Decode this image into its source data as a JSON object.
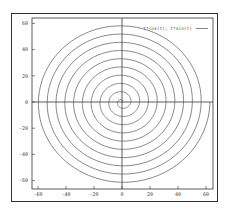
{
  "chart_data": {
    "type": "line",
    "title": "",
    "xlabel": "",
    "ylabel": "",
    "parametric": true,
    "series": [
      {
        "name": "t*cos(t), t*sin(t)",
        "x_expr": "t*cos(t)",
        "y_expr": "t*sin(t)",
        "t_range": [
          0,
          62.83
        ],
        "turns": 10,
        "color": "#555555"
      }
    ],
    "xticks": [
      -60,
      -40,
      -20,
      0,
      20,
      40,
      60
    ],
    "yticks": [
      60,
      40,
      20,
      0,
      -20,
      -40,
      -60
    ],
    "xlim": [
      -64,
      65
    ],
    "ylim": [
      -66,
      64
    ],
    "grid": false,
    "zero_axes": true,
    "legend_position": "top-right"
  },
  "legend": {
    "label": "t*cos(t), t*sin(t)"
  },
  "colors": {
    "line": "#555555",
    "axis": "#333333",
    "frame": "#333333"
  }
}
